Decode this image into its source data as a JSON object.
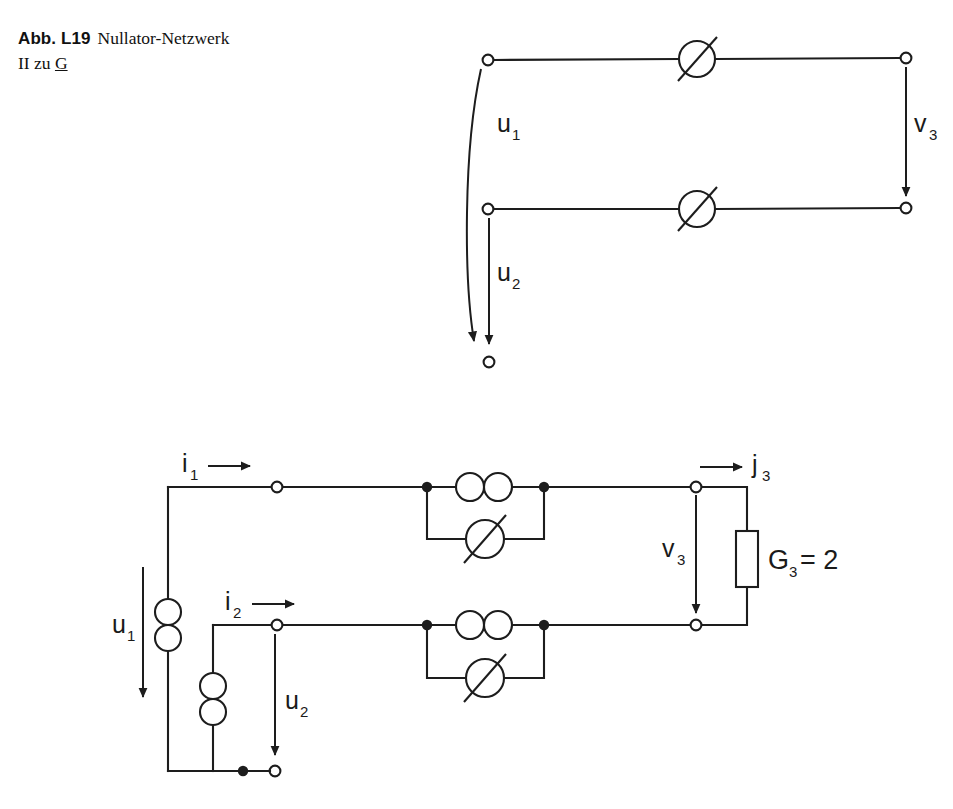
{
  "caption": {
    "figure_number": "Abb. L19",
    "title_line1": "Nullator-Netzwerk",
    "title_line2_prefix": "II zu ",
    "title_line2_underlined": "G"
  },
  "colors": {
    "ink": "#1d1d1d",
    "background": "#ffffff"
  },
  "figures": [
    {
      "id": "top-network",
      "name": "nullator-network-abstract",
      "labels": {
        "u1": "u",
        "u1_sub": "1",
        "u2": "u",
        "u2_sub": "2",
        "v3": "v",
        "v3_sub": "3"
      },
      "elements": [
        {
          "type": "nullator",
          "name": "nullator-top",
          "cx": 697,
          "cy": 59
        },
        {
          "type": "nullator",
          "name": "nullator-bottom",
          "cx": 697,
          "cy": 209
        },
        {
          "type": "terminal",
          "name": "terminal-input-top",
          "cx": 488,
          "cy": 60
        },
        {
          "type": "terminal",
          "name": "terminal-input-bottom",
          "cx": 488,
          "cy": 209
        },
        {
          "type": "terminal",
          "name": "terminal-output-top",
          "cx": 906,
          "cy": 58
        },
        {
          "type": "terminal",
          "name": "terminal-output-bottom",
          "cx": 906,
          "cy": 208
        },
        {
          "type": "terminal",
          "name": "terminal-reference-bottom",
          "cx": 489,
          "cy": 362
        }
      ]
    },
    {
      "id": "bottom-network",
      "name": "nullor-network-with-conductance",
      "labels": {
        "i1": "i",
        "i1_sub": "1",
        "i2": "i",
        "i2_sub": "2",
        "j3": "j",
        "j3_sub": "3",
        "u1": "u",
        "u1_sub": "1",
        "u2": "u",
        "u2_sub": "2",
        "v3": "v",
        "v3_sub": "3",
        "g3": "G",
        "g3_sub": "3",
        "g3_equals_value": "= 2"
      },
      "component_values": {
        "G3": "2"
      },
      "elements": [
        {
          "type": "norator-vertical",
          "name": "norator-port1",
          "cx": 198,
          "cy": 625
        },
        {
          "type": "norator-vertical",
          "name": "norator-port2",
          "cx": 243,
          "cy": 699
        },
        {
          "type": "norator-horizontal",
          "name": "norator-upper-branch",
          "cx": 484,
          "cy": 487
        },
        {
          "type": "nullator",
          "name": "nullator-upper-branch",
          "cx": 485,
          "cy": 539
        },
        {
          "type": "norator-horizontal",
          "name": "norator-lower-branch",
          "cx": 484,
          "cy": 625
        },
        {
          "type": "nullator",
          "name": "nullator-lower-branch",
          "cx": 485,
          "cy": 678
        },
        {
          "type": "resistor",
          "name": "conductance-g3",
          "cx": 747,
          "cy": 559
        },
        {
          "type": "terminal",
          "name": "terminal-in-top",
          "cx": 277,
          "cy": 487
        },
        {
          "type": "terminal",
          "name": "terminal-in-mid",
          "cx": 277,
          "cy": 625
        },
        {
          "type": "terminal",
          "name": "terminal-in-bottom",
          "cx": 275,
          "cy": 771
        },
        {
          "type": "terminal",
          "name": "terminal-out-top",
          "cx": 696,
          "cy": 487
        },
        {
          "type": "terminal",
          "name": "terminal-out-bottom",
          "cx": 696,
          "cy": 625
        },
        {
          "type": "junction",
          "name": "junction-upper-left",
          "cx": 427,
          "cy": 487
        },
        {
          "type": "junction",
          "name": "junction-upper-right",
          "cx": 544,
          "cy": 487
        },
        {
          "type": "junction",
          "name": "junction-lower-left",
          "cx": 427,
          "cy": 625
        },
        {
          "type": "junction",
          "name": "junction-lower-right",
          "cx": 544,
          "cy": 625
        },
        {
          "type": "junction",
          "name": "junction-bottom-rail",
          "cx": 243,
          "cy": 771
        }
      ]
    }
  ]
}
